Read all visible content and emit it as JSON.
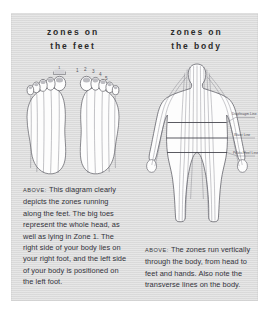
{
  "page": {
    "background_color": "#ffffff",
    "panel_color": "#dcdcdc"
  },
  "left_column": {
    "heading_line1": "zones on",
    "heading_line2": "the feet",
    "figure_name": "two-footprints-soles-with-vertical-zone-lines",
    "zone_numbers_left_foot": [
      "1",
      "2",
      "3",
      "4",
      "5"
    ],
    "zone_numbers_right_foot": [
      "1",
      "2",
      "3",
      "4",
      "5"
    ],
    "zone_bracket_label": "1",
    "caption_lead": "ABOVE:",
    "caption_text": "This diagram clearly depicts the zones running along the feet. The big toes represent the whole head, as well as lying in Zone 1. The right side of your body lies on your right foot, and the left side of your body is positioned on the left foot."
  },
  "right_column": {
    "heading_line1": "zones on",
    "heading_line2": "the body",
    "figure_name": "standing-human-body-outline-with-vertical-zone-lines",
    "body_labels": [
      "Diaphragm Line",
      "Waist Line",
      "Pelvic/Heel Line"
    ],
    "caption_lead": "ABOVE:",
    "caption_text": "The zones run vertically through the body, from head to feet and hands. Also note the transverse lines on the body."
  }
}
